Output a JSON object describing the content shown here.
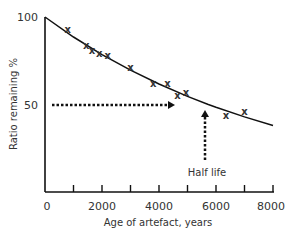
{
  "chart_data": {
    "type": "scatter",
    "title": "",
    "xlabel": "Age of artefact, years",
    "ylabel": "Ratio remaining %",
    "xlim": [
      0,
      8000
    ],
    "ylim": [
      0,
      100
    ],
    "x_ticks": [
      0,
      1000,
      2000,
      3000,
      4000,
      5000,
      6000,
      7000,
      8000
    ],
    "x_tick_labels": [
      "0",
      "2000",
      "4000",
      "6000",
      "8000"
    ],
    "y_tick_labels": [
      "50",
      "100"
    ],
    "grid": false,
    "series": [
      {
        "name": "measurements",
        "marker": "x",
        "x": [
          800,
          1450,
          1650,
          1900,
          2200,
          3000,
          3800,
          4300,
          4650,
          4950,
          6350,
          7000
        ],
        "y": [
          93,
          84,
          81,
          79,
          78,
          71,
          62,
          62,
          55,
          57,
          44,
          46
        ]
      },
      {
        "name": "decay curve",
        "type": "line",
        "x": [
          0,
          1000,
          2000,
          3000,
          4000,
          5000,
          5730,
          6000,
          7000,
          8000
        ],
        "y": [
          100,
          88.6,
          78.5,
          69.6,
          61.7,
          54.6,
          50,
          48.4,
          42.9,
          38
        ]
      }
    ],
    "annotations": [
      {
        "type": "dotted-arrow",
        "from": [
          0,
          50
        ],
        "to": [
          4600,
          50
        ],
        "direction": "right"
      },
      {
        "type": "dotted-arrow",
        "from": [
          5700,
          13
        ],
        "to": [
          5700,
          47
        ],
        "direction": "up"
      },
      {
        "type": "text",
        "text": "Half life",
        "x": 5700,
        "y": 8
      }
    ]
  }
}
